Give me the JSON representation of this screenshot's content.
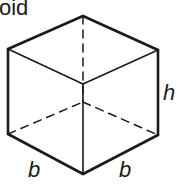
{
  "figure": {
    "title_fragment": "oid",
    "shape": "cuboid",
    "labels": {
      "height": "h",
      "base_left": "b",
      "base_right": "b"
    },
    "colors": {
      "stroke": "#1a1a1a",
      "background": "#ffffff"
    },
    "vertices": {
      "top_back": [
        83,
        16
      ],
      "top_left": [
        8,
        49
      ],
      "top_right": [
        158,
        50
      ],
      "top_front": [
        83,
        84
      ],
      "bottom_left": [
        8,
        134
      ],
      "bottom_right": [
        158,
        135
      ],
      "bottom_front": [
        83,
        174
      ],
      "bottom_back_hidden": [
        83,
        102
      ]
    }
  }
}
